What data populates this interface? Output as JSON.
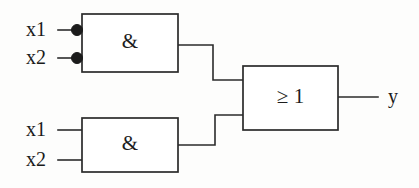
{
  "diagram": {
    "notation": "IEC rectangular logic symbols",
    "background_color": "#fdfdfc",
    "line_color": "#2b2b2b"
  },
  "gates": {
    "and_top": {
      "label": "&",
      "name": "AND gate (top)",
      "x": 82,
      "y": 14,
      "width": 96,
      "height": 58,
      "inputs": [
        {
          "label": "x1",
          "y": 30,
          "inverted": true
        },
        {
          "label": "x2",
          "y": 58,
          "inverted": true
        }
      ]
    },
    "and_bottom": {
      "label": "&",
      "name": "AND gate (bottom)",
      "x": 82,
      "y": 118,
      "width": 96,
      "height": 54,
      "inputs": [
        {
          "label": "x1",
          "y": 130,
          "inverted": false
        },
        {
          "label": "x2",
          "y": 160,
          "inverted": false
        }
      ]
    },
    "or_out": {
      "label": "≥ 1",
      "name": "OR gate (output)",
      "x": 243,
      "y": 66,
      "width": 95,
      "height": 64,
      "inputs": [
        {
          "y": 80
        },
        {
          "y": 115
        }
      ]
    }
  },
  "ports": {
    "inputs": [
      {
        "label": "x1",
        "x": 26,
        "y": 30
      },
      {
        "label": "x2",
        "x": 26,
        "y": 58
      },
      {
        "label": "x1",
        "x": 26,
        "y": 130
      },
      {
        "label": "x2",
        "x": 26,
        "y": 160
      }
    ],
    "output": {
      "label": "y",
      "x": 388,
      "y": 97
    }
  },
  "wires": {
    "in_top_1": "M 58 30 L 72 30",
    "in_top_2": "M 58 58 L 72 58",
    "in_bot_1": "M 58 130 L 82 130",
    "in_bot_2": "M 58 160 L 82 160",
    "and_top_to_or": "M 178 45 L 213 45 L 213 80 L 243 80",
    "and_bot_to_or": "M 178 145 L 215 145 L 215 115 L 243 115",
    "or_to_out": "M 338 97 L 378 97"
  },
  "bubbles": [
    {
      "cx": 77,
      "cy": 30,
      "r": 5.5
    },
    {
      "cx": 77,
      "cy": 58,
      "r": 5.5
    }
  ]
}
